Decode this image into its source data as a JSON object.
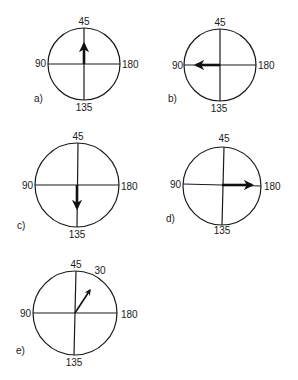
{
  "diagrams": [
    {
      "id": "a",
      "label": "a)",
      "cx": 84,
      "cy": 64,
      "r": 36,
      "ticks": {
        "top": "45",
        "left": "90",
        "right": "180",
        "bottom": "135"
      },
      "arrow": {
        "from": [
          84,
          64
        ],
        "to": [
          84,
          43
        ],
        "direction": "up (toward 45)"
      },
      "label_pos": [
        35,
        100
      ]
    },
    {
      "id": "b",
      "label": "b)",
      "cx": 220,
      "cy": 65,
      "r": 36,
      "ticks": {
        "top": "45",
        "left": "90",
        "right": "180",
        "bottom": "135"
      },
      "arrow": {
        "from": [
          220,
          65
        ],
        "to": [
          195,
          65
        ],
        "direction": "left (toward 90)"
      },
      "label_pos": [
        170,
        102
      ]
    },
    {
      "id": "c",
      "label": "c)",
      "cx": 77,
      "cy": 185,
      "r": 42,
      "ticks": {
        "top": "45",
        "left": "90",
        "right": "180",
        "bottom": "135"
      },
      "arrow": {
        "from": [
          77,
          185
        ],
        "to": [
          77,
          208
        ],
        "direction": "down (toward 135)"
      },
      "label_pos": [
        18,
        227
      ]
    },
    {
      "id": "d",
      "label": "d)",
      "cx": 222,
      "cy": 186,
      "r": 39,
      "ticks": {
        "top": "45",
        "left": "90",
        "right": "180",
        "bottom": "135"
      },
      "arrow": {
        "from": [
          222,
          186
        ],
        "to": [
          252,
          186
        ],
        "direction": "right (toward 180)"
      },
      "label_pos": [
        165,
        220
      ]
    },
    {
      "id": "e",
      "label": "e)",
      "cx": 75,
      "cy": 313,
      "r": 42,
      "ticks": {
        "top": "45",
        "left": "90",
        "right": "180",
        "bottom": "135",
        "extra": "30"
      },
      "arrow": {
        "from": [
          75,
          313
        ],
        "to": [
          91,
          289
        ],
        "direction": "up-right (toward 30)"
      },
      "label_pos": [
        17,
        352
      ]
    }
  ]
}
